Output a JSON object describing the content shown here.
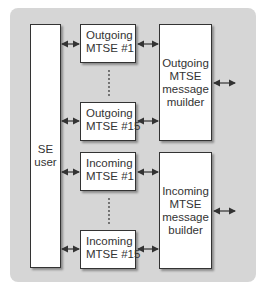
{
  "diagram": {
    "se_user": {
      "lines": [
        "SE",
        "user"
      ]
    },
    "outgoing_mtse_first": {
      "lines": [
        "Outgoing",
        "MTSE #1"
      ]
    },
    "outgoing_mtse_last": {
      "lines": [
        "Outgoing",
        "MTSE #15"
      ]
    },
    "incoming_mtse_first": {
      "lines": [
        "Incoming",
        "MTSE #1"
      ]
    },
    "incoming_mtse_last": {
      "lines": [
        "Incoming",
        "MTSE #15"
      ]
    },
    "outgoing_builder": {
      "lines": [
        "Outgoing",
        "MTSE",
        "message",
        "muilder"
      ]
    },
    "incoming_builder": {
      "lines": [
        "Incoming",
        "MTSE",
        "message",
        "builder"
      ]
    },
    "colors": {
      "panel": "#d6d6d6",
      "box_fill": "#ffffff",
      "stroke": "#333333"
    }
  }
}
